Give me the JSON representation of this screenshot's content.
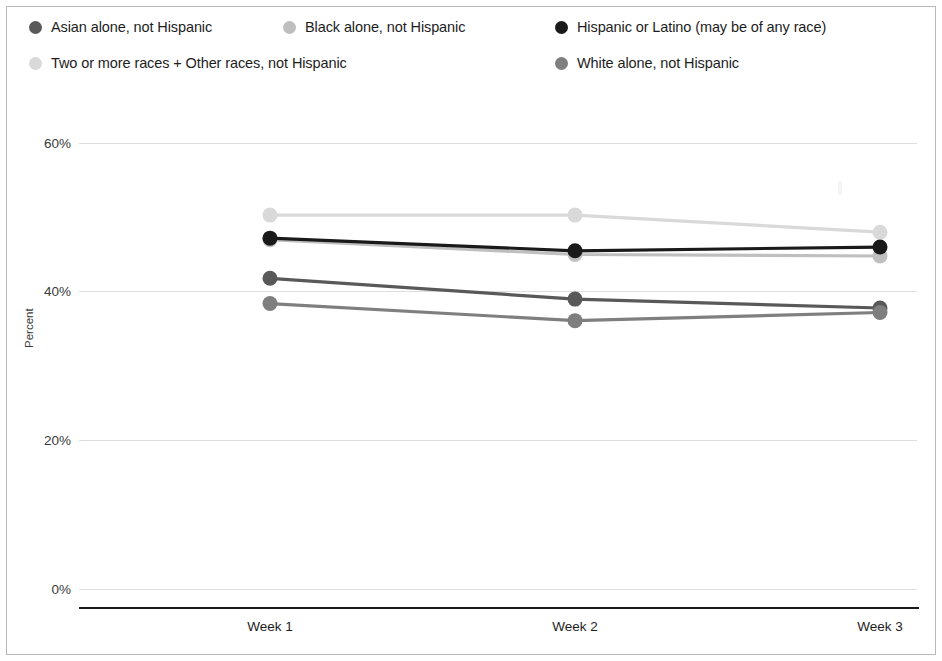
{
  "legend": {
    "items": [
      {
        "label": "Asian alone, not Hispanic",
        "color": "#595959",
        "marker": "legend-dot"
      },
      {
        "label": "Black alone, not Hispanic",
        "color": "#bfbfbf",
        "marker": "legend-dot"
      },
      {
        "label": "Hispanic or Latino (may be of any race)",
        "color": "#1a1a1a",
        "marker": "legend-dot"
      },
      {
        "label": "Two or more races + Other races, not Hispanic",
        "color": "#d9d9d9",
        "marker": "legend-dot"
      },
      {
        "label": "White alone, not Hispanic",
        "color": "#7f7f7f",
        "marker": "legend-dot"
      }
    ]
  },
  "chart_data": {
    "type": "line",
    "title": "",
    "xlabel": "",
    "ylabel": "Percent",
    "categories": [
      "Week 1",
      "Week 2",
      "Week 3"
    ],
    "ylim": [
      0,
      60
    ],
    "yticks": [
      0,
      20,
      40,
      60
    ],
    "ytick_labels": [
      "0%",
      "20%",
      "40%",
      "60%"
    ],
    "grid": true,
    "legend_position": "top",
    "series": [
      {
        "name": "Asian alone, not Hispanic",
        "color": "#595959",
        "values": [
          41.8,
          39.0,
          37.8
        ]
      },
      {
        "name": "Black alone, not Hispanic",
        "color": "#bfbfbf",
        "values": [
          47.0,
          45.0,
          44.8
        ]
      },
      {
        "name": "Hispanic or Latino (may be of any race)",
        "color": "#1a1a1a",
        "values": [
          47.2,
          45.5,
          46.0
        ]
      },
      {
        "name": "Two or more races + Other races, not Hispanic",
        "color": "#d9d9d9",
        "values": [
          50.3,
          50.3,
          48.0
        ]
      },
      {
        "name": "White alone, not Hispanic",
        "color": "#7f7f7f",
        "values": [
          38.4,
          36.1,
          37.2
        ]
      }
    ]
  }
}
